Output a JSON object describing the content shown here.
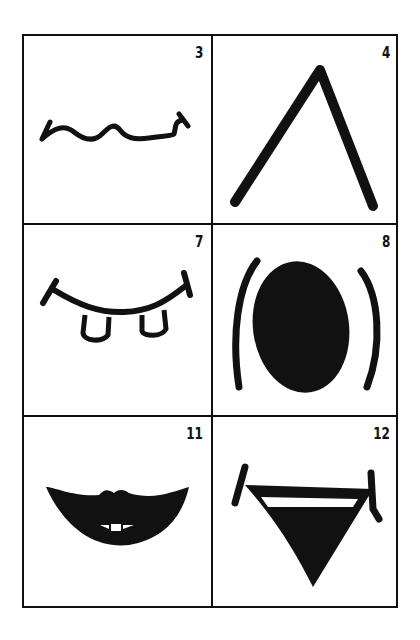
{
  "figure": {
    "type": "grid of mouth-shape drawings",
    "rows": 3,
    "columns": 2,
    "panels": [
      {
        "number": "3",
        "shape": "wavy-line-mouth"
      },
      {
        "number": "4",
        "shape": "inverted-v-mouth"
      },
      {
        "number": "7",
        "shape": "smile-with-two-teeth"
      },
      {
        "number": "8",
        "shape": "open-oval-mouth-with-brackets"
      },
      {
        "number": "11",
        "shape": "filled-lips-with-teeth"
      },
      {
        "number": "12",
        "shape": "triangular-open-mouth"
      }
    ]
  }
}
